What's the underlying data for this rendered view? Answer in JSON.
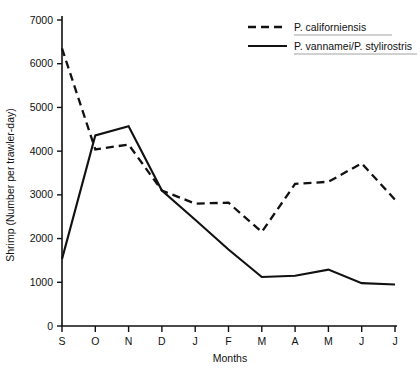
{
  "chart_data": {
    "type": "line",
    "title": "",
    "xlabel": "Months",
    "ylabel": "Shrimp (Number per trawler-day)",
    "categories": [
      "S",
      "O",
      "N",
      "D",
      "J",
      "F",
      "M",
      "A",
      "M",
      "J",
      "J"
    ],
    "x_tick_labels": [
      "S",
      "O",
      "N",
      "D",
      "J",
      "F",
      "M",
      "A",
      "M",
      "J",
      "J"
    ],
    "y_tick_labels": [
      "0",
      "1000",
      "2000",
      "3000",
      "4000",
      "5000",
      "6000",
      "7000"
    ],
    "y_tick_values": [
      0,
      1000,
      2000,
      3000,
      4000,
      5000,
      6000,
      7000
    ],
    "ylim": [
      0,
      7000
    ],
    "grid": false,
    "legend_position": "top-right",
    "series": [
      {
        "name": "P. californiensis",
        "style": "dashed",
        "color": "#111111",
        "values": [
          6350,
          4040,
          4150,
          3100,
          2800,
          2820,
          2150,
          3250,
          3300,
          3720,
          2890
        ]
      },
      {
        "name": "P. vannamei/P. stylirostris",
        "style": "solid",
        "color": "#111111",
        "values": [
          1530,
          4360,
          4570,
          3100,
          2430,
          1750,
          1120,
          1150,
          1290,
          980,
          950
        ]
      }
    ]
  },
  "legend": {
    "entries": [
      {
        "label": "P. californiensis",
        "style": "dashed"
      },
      {
        "label": "P. vannamei/P. stylirostris",
        "style": "solid"
      }
    ]
  }
}
